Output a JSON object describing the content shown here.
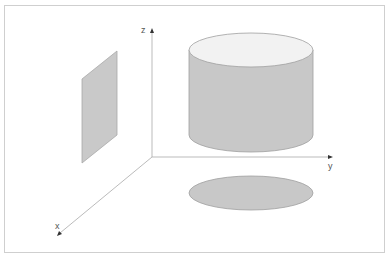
{
  "diagram": {
    "axes": {
      "x_label": "x",
      "y_label": "y",
      "z_label": "z"
    },
    "shapes": [
      {
        "name": "parallelogram",
        "description": "flat plane parallel to x-z"
      },
      {
        "name": "cylinder",
        "description": "upright cylinder above x-y plane"
      },
      {
        "name": "ellipse",
        "description": "projection of cylinder onto x-y plane"
      }
    ],
    "colors": {
      "fill": "#c8c8c8",
      "top_fill": "#f0f0f0",
      "stroke": "#9a9a9a",
      "axis": "#aaaaaa",
      "frame": "#cccccc"
    }
  }
}
